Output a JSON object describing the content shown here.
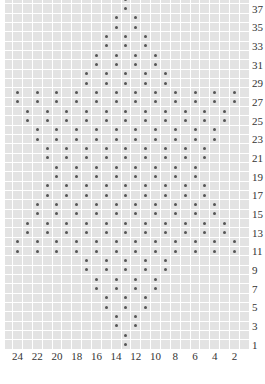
{
  "chart": {
    "type": "knitting-chart",
    "columns": 24,
    "rows": 38,
    "symbol": "dot",
    "colors": {
      "cell": "#e3e3e3",
      "gridline": "#ffffff",
      "dot": "#555555",
      "label": "#333333"
    }
  },
  "row_labels": [
    "37",
    "35",
    "33",
    "31",
    "29",
    "27",
    "25",
    "23",
    "21",
    "19",
    "17",
    "15",
    "13",
    "11",
    "9",
    "7",
    "5",
    "3",
    "1"
  ],
  "col_labels": [
    "24",
    "22",
    "20",
    "18",
    "16",
    "14",
    "12",
    "10",
    "8",
    "6",
    "4",
    "2"
  ],
  "pattern": [
    {
      "rows": [
        1,
        2
      ],
      "cols": [
        13
      ]
    },
    {
      "rows": [
        3,
        4
      ],
      "cols": [
        14,
        12
      ]
    },
    {
      "rows": [
        5,
        6
      ],
      "cols": [
        15,
        13,
        11
      ]
    },
    {
      "rows": [
        7,
        8
      ],
      "cols": [
        16,
        14,
        12,
        10
      ]
    },
    {
      "rows": [
        9,
        10
      ],
      "cols": [
        17,
        15,
        13,
        11,
        9
      ]
    },
    {
      "rows": [
        11,
        12
      ],
      "cols": [
        24,
        22,
        20,
        18,
        16,
        14,
        12,
        10,
        8,
        6,
        4,
        2
      ]
    },
    {
      "rows": [
        13,
        14
      ],
      "cols": [
        23,
        21,
        19,
        17,
        15,
        13,
        11,
        9,
        7,
        5,
        3
      ]
    },
    {
      "rows": [
        15,
        16
      ],
      "cols": [
        22,
        20,
        18,
        16,
        14,
        12,
        10,
        8,
        6,
        4
      ]
    },
    {
      "rows": [
        17,
        18
      ],
      "cols": [
        21,
        19,
        17,
        15,
        13,
        11,
        9,
        7,
        5
      ]
    },
    {
      "rows": [
        19,
        20
      ],
      "cols": [
        20,
        18,
        16,
        14,
        12,
        10,
        8,
        6
      ]
    },
    {
      "rows": [
        21,
        22
      ],
      "cols": [
        21,
        19,
        17,
        15,
        13,
        11,
        9,
        7,
        5
      ]
    },
    {
      "rows": [
        23,
        24
      ],
      "cols": [
        22,
        20,
        18,
        16,
        14,
        12,
        10,
        8,
        6,
        4
      ]
    },
    {
      "rows": [
        25,
        26
      ],
      "cols": [
        23,
        21,
        19,
        17,
        15,
        13,
        11,
        9,
        7,
        5,
        3
      ]
    },
    {
      "rows": [
        27,
        28
      ],
      "cols": [
        24,
        22,
        20,
        18,
        16,
        14,
        12,
        10,
        8,
        6,
        4,
        2
      ]
    },
    {
      "rows": [
        29,
        30
      ],
      "cols": [
        17,
        15,
        13,
        11,
        9
      ]
    },
    {
      "rows": [
        31,
        32
      ],
      "cols": [
        16,
        14,
        12,
        10
      ]
    },
    {
      "rows": [
        33,
        34
      ],
      "cols": [
        15,
        13,
        11
      ]
    },
    {
      "rows": [
        35,
        36
      ],
      "cols": [
        14,
        12
      ]
    },
    {
      "rows": [
        37,
        38
      ],
      "cols": [
        13
      ]
    }
  ]
}
